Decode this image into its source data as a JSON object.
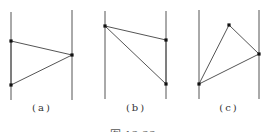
{
  "figure": {
    "caption": "图 13.33",
    "line_color": "#555555",
    "point_color": "#111111",
    "panels": [
      {
        "label": "(a)",
        "label_x": 42,
        "verticals": [
          {
            "x": 11,
            "y1": 12,
            "y2": 100
          },
          {
            "x": 72,
            "y1": 10,
            "y2": 100
          }
        ],
        "points": [
          [
            11,
            41
          ],
          [
            72,
            55
          ],
          [
            11,
            85
          ]
        ]
      },
      {
        "label": "(b)",
        "label_x": 136,
        "verticals": [
          {
            "x": 105,
            "y1": 11,
            "y2": 99
          },
          {
            "x": 166,
            "y1": 11,
            "y2": 99
          }
        ],
        "points": [
          [
            105,
            26
          ],
          [
            166,
            40
          ],
          [
            166,
            84
          ]
        ]
      },
      {
        "label": "(c)",
        "label_x": 229,
        "verticals": [
          {
            "x": 199,
            "y1": 10,
            "y2": 99
          },
          {
            "x": 259,
            "y1": 10,
            "y2": 99
          }
        ],
        "points": [
          [
            229,
            25
          ],
          [
            259,
            54
          ],
          [
            199,
            84
          ]
        ]
      }
    ]
  }
}
